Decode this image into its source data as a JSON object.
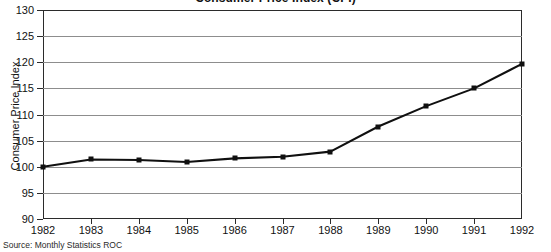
{
  "chart_data": {
    "type": "line",
    "title": "Consumer Price Index (CPI)",
    "xlabel": "",
    "ylabel": "Consumer Price Index",
    "categories": [
      "1982",
      "1983",
      "1984",
      "1985",
      "1986",
      "1987",
      "1988",
      "1989",
      "1990",
      "1991",
      "1992"
    ],
    "values": [
      100.0,
      101.4,
      101.3,
      100.9,
      101.6,
      101.9,
      102.9,
      107.7,
      111.6,
      115.0,
      119.7
    ],
    "series": [
      {
        "name": "Consumer Price Index",
        "values": [
          100.0,
          101.4,
          101.3,
          100.9,
          101.6,
          101.9,
          102.9,
          107.7,
          111.6,
          115.0,
          119.7
        ]
      }
    ],
    "ylim": [
      90,
      130
    ],
    "ytick_values": [
      90,
      95,
      100,
      105,
      110,
      115,
      120,
      125,
      130
    ],
    "ytick_labels": [
      "90",
      "95",
      "100",
      "105",
      "110",
      "115",
      "120",
      "125",
      "130"
    ],
    "xtick_labels": [
      "1982",
      "1983",
      "1984",
      "1985",
      "1986",
      "1987",
      "1988",
      "1989",
      "1990",
      "1991",
      "1992"
    ],
    "grid": true,
    "grid_axis": "y",
    "legend": false,
    "legend_position": "none",
    "marker": "square",
    "line_color": "#101010",
    "grid_color": "#8d8d8d",
    "axis_color": "#2b2b2b",
    "annotations": [
      "Source: Monthly Statistics ROC"
    ]
  },
  "footer": {
    "source": "Source: Monthly Statistics ROC"
  }
}
